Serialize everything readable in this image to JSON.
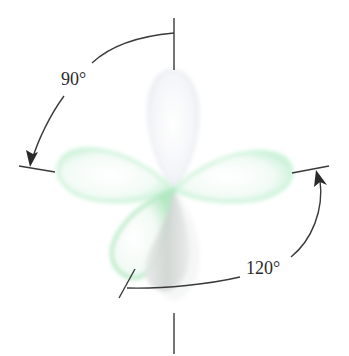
{
  "diagram": {
    "type": "orbital-geometry",
    "colors": {
      "lobe_green_edge": "#b8f0cc",
      "lobe_green_fill": "#eafaf0",
      "lobe_gray": "#d4d8d6",
      "lobe_top": "#f1f3f6",
      "line": "#3a3a3a"
    },
    "lobes": [
      {
        "name": "top",
        "direction": "up"
      },
      {
        "name": "left",
        "direction": "left"
      },
      {
        "name": "right",
        "direction": "right"
      },
      {
        "name": "bottom-front",
        "direction": "down-left"
      },
      {
        "name": "bottom-back",
        "direction": "down"
      }
    ],
    "angles": [
      {
        "label": "90°",
        "between": [
          "top axis",
          "left axis"
        ]
      },
      {
        "label": "120°",
        "between": [
          "bottom-left axis",
          "right axis"
        ]
      }
    ]
  }
}
